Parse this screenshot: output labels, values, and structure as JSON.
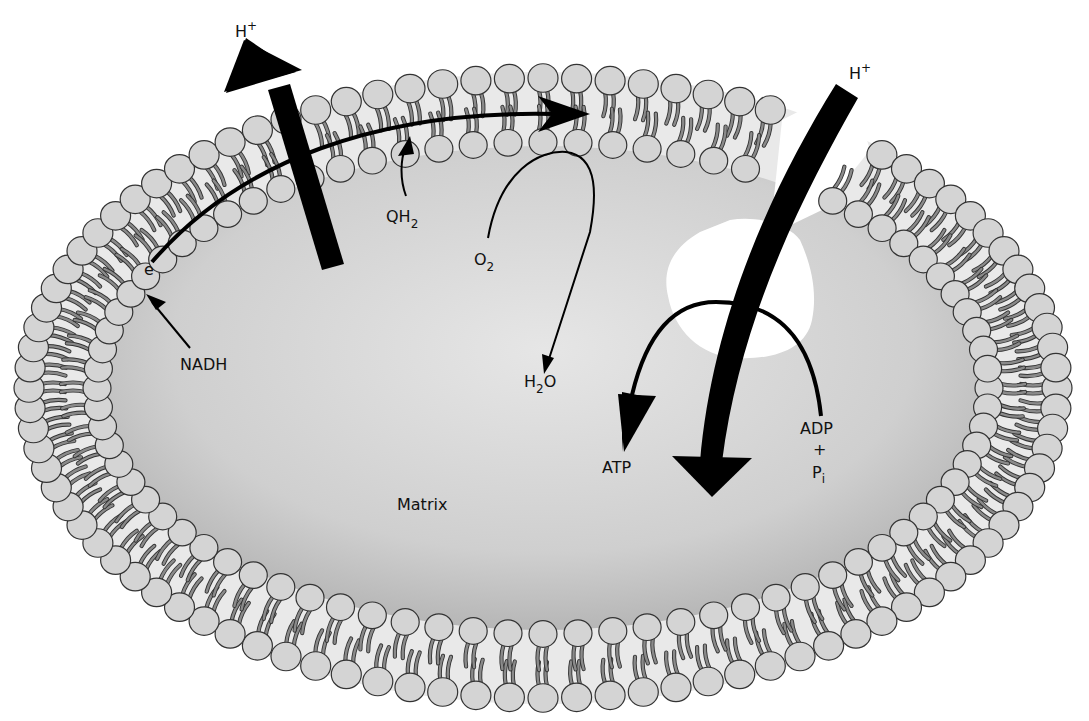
{
  "diagram": {
    "colors": {
      "background": "#ffffff",
      "matrix_light": "#e6e6e6",
      "matrix_dark": "#b9b9b9",
      "lipid_head": "#d4d4d4",
      "lipid_outline": "#333333",
      "bilayer_core": "#e9e9e9",
      "arrow": "#000000",
      "atp_synthase": "#ffffff"
    },
    "labels": {
      "h_plus_left": {
        "base": "H",
        "sup": "+"
      },
      "h_plus_right": {
        "base": "H",
        "sup": "+"
      },
      "electron": "e",
      "nadh": "NADH",
      "qh2": {
        "base": "QH",
        "sub": "2"
      },
      "o2": {
        "base": "O",
        "sub": "2"
      },
      "h2o": {
        "pre": "H",
        "sub": "2",
        "post": "O"
      },
      "atp": "ATP",
      "adp": "ADP",
      "plus": "+",
      "pi": {
        "base": "P",
        "sub": "i"
      },
      "matrix": "Matrix"
    },
    "membrane": {
      "center": [
        543,
        388
      ],
      "outer_radii": [
        522,
        318
      ],
      "inner_radii": [
        440,
        240
      ],
      "gap_angle_deg": [
        -62,
        -52
      ]
    }
  }
}
